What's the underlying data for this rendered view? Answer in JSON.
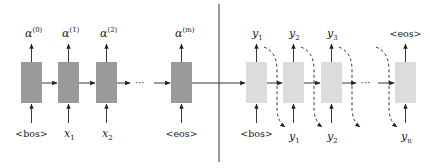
{
  "diagram": {
    "colors": {
      "encoder_box": "#9a9a9a",
      "decoder_box": "#dcdcdc",
      "arrow": "#222222",
      "divider": "#333333"
    },
    "encoder": {
      "cells": [
        {
          "output_base": "α",
          "output_sup": "(0)",
          "input_base": "<bos>",
          "input_sub": ""
        },
        {
          "output_base": "α",
          "output_sup": "(1)",
          "input_base": "x",
          "input_sub": "1"
        },
        {
          "output_base": "α",
          "output_sup": "(2)",
          "input_base": "x",
          "input_sub": "2"
        },
        {
          "output_base": "α",
          "output_sup": "(m)",
          "input_base": "<eos>",
          "input_sub": ""
        }
      ],
      "ellipsis": "···"
    },
    "decoder": {
      "cells": [
        {
          "output_base": "y",
          "output_sub": "1",
          "input_base": "<bos>",
          "input_sub": ""
        },
        {
          "output_base": "y",
          "output_sub": "2",
          "input_base": "y",
          "input_sub": "1"
        },
        {
          "output_base": "y",
          "output_sub": "3",
          "input_base": "y",
          "input_sub": "2"
        },
        {
          "output_base": "<eos>",
          "output_sub": "",
          "input_base": "y",
          "input_sub": "n"
        }
      ],
      "ellipsis": "···"
    }
  }
}
